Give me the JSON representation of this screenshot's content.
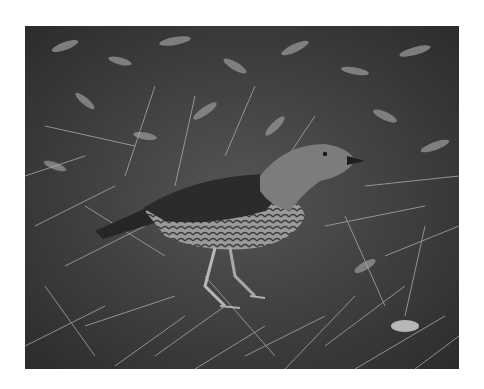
{
  "image": {
    "alt": "Grayscale photo of a bird with a scalloped breast standing on grass and leaf litter",
    "subject": "bird",
    "setting": "ground covered with dry grass and fallen leaves",
    "tone": "grayscale",
    "colors": {
      "background": "#ffffff",
      "ground_dark": "#2e2e2e",
      "ground_mid": "#5a5a5a",
      "grass_light": "#a8a8a8",
      "bird_wing": "#2a2a2a",
      "bird_body": "#8a8a8a",
      "bird_head": "#7a7a7a"
    }
  }
}
